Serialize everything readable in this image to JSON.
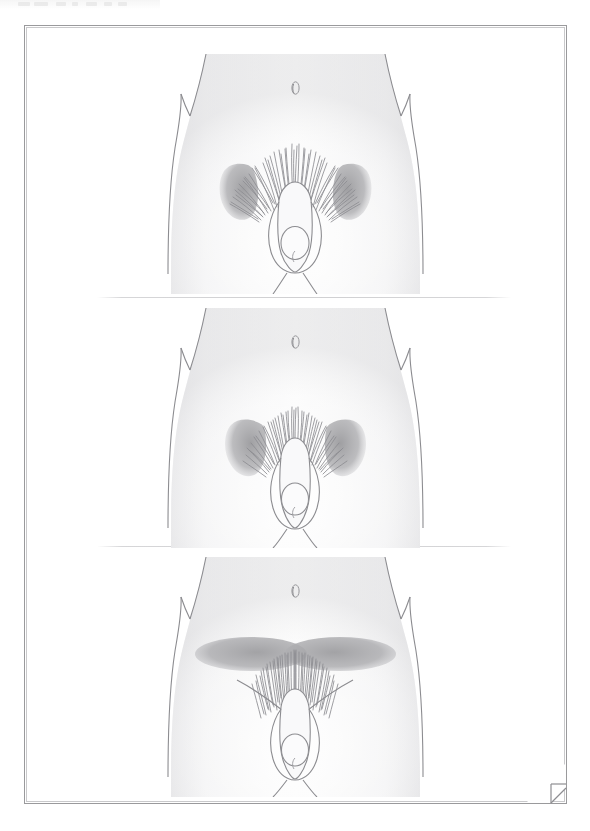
{
  "document": {
    "kind": "scanned-illustration-page",
    "page_background": "#ffffff",
    "border_color": "#9a9a9c",
    "has_corner_fold": true
  },
  "toolbar_strip": {
    "visible": true,
    "note": "partially cropped toolbar remnant, text illegible",
    "segments": [
      {
        "left": 18,
        "width": 12
      },
      {
        "left": 34,
        "width": 14
      },
      {
        "left": 56,
        "width": 10
      },
      {
        "left": 72,
        "width": 6
      },
      {
        "left": 86,
        "width": 11
      },
      {
        "left": 104,
        "width": 8
      },
      {
        "left": 118,
        "width": 9
      }
    ]
  },
  "illustration": {
    "title": "",
    "subject": "male pelvic region, frontal view",
    "palette": {
      "outline": "#8c8c90",
      "skin_light": "#fdfdfd",
      "skin_mid": "#f0f0f1",
      "skin_shade": "#e4e4e6",
      "hair_stroke": "#8e8e92",
      "shaded_zone": "#a9a9ab",
      "divider": "#d3d3d5"
    },
    "panels": [
      {
        "id": "panel-1",
        "index": 1,
        "label": "",
        "hair_pattern": "broad escutcheon with lateral inguinal wings",
        "shaded_zones": [
          "left-inguinal-wing",
          "right-inguinal-wing"
        ],
        "shaded_zone_shape": "leaf",
        "hair_spread": "wide",
        "hair_tufts": 52,
        "hair_field": {
          "cx": 270,
          "cy": 118,
          "rx": 58,
          "ry": 42
        }
      },
      {
        "id": "panel-2",
        "index": 2,
        "label": "",
        "hair_pattern": "narrow escutcheon with lateral inguinal wings",
        "shaded_zones": [
          "left-inguinal-wing",
          "right-inguinal-wing"
        ],
        "shaded_zone_shape": "leaf",
        "hair_spread": "narrow",
        "hair_tufts": 44,
        "hair_field": {
          "cx": 270,
          "cy": 120,
          "rx": 44,
          "ry": 38
        }
      },
      {
        "id": "panel-3",
        "index": 3,
        "label": "",
        "hair_pattern": "low escutcheon with horizontal suprapubic band",
        "shaded_zones": [
          "left-suprapubic-ellipse",
          "right-suprapubic-ellipse"
        ],
        "shaded_zone_shape": "horizontal-ellipse",
        "hair_spread": "downward",
        "hair_tufts": 40,
        "hair_field": {
          "cx": 270,
          "cy": 122,
          "rx": 42,
          "ry": 32
        }
      }
    ],
    "anatomy_parts": [
      "torso-outline",
      "navel",
      "iliac-crest-notch-left",
      "iliac-crest-notch-right",
      "pubic-hair",
      "penis-outline",
      "glans-outline",
      "scrotum-outline",
      "inner-thigh-left",
      "inner-thigh-right"
    ]
  }
}
